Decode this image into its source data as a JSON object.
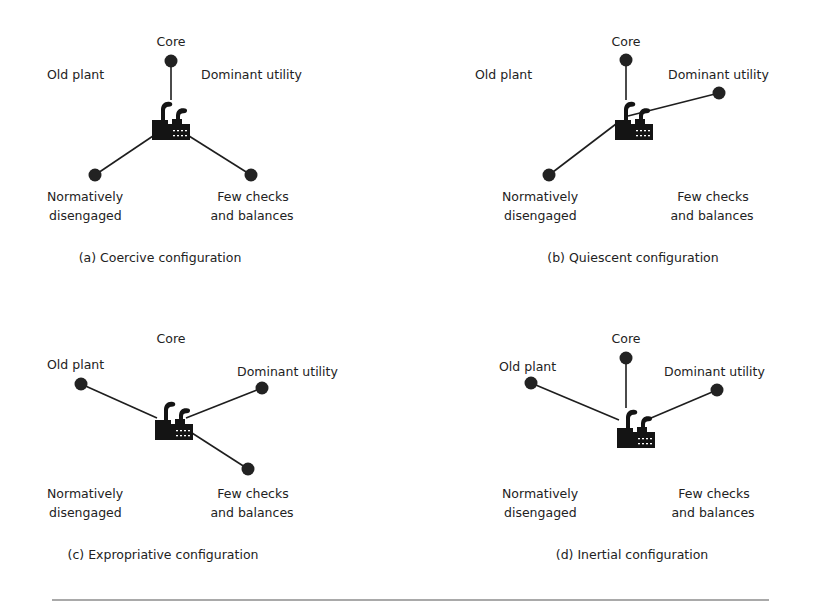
{
  "figure": {
    "panels": [
      {
        "id": "a",
        "caption": "(a) Coercive configuration",
        "caption_pos": [
          160,
          262
        ],
        "factory": [
          152,
          100
        ],
        "labels": {
          "core": {
            "text": "Core",
            "pos": [
              171,
              46
            ],
            "anchor": "middle"
          },
          "old_plant": {
            "text": "Old plant",
            "pos": [
              47,
              79
            ],
            "anchor": "start"
          },
          "dominant_utility": {
            "text": "Dominant utility",
            "pos": [
              201,
              79
            ],
            "anchor": "start"
          },
          "normatively_1": {
            "text": "Normatively",
            "pos": [
              47,
              201
            ],
            "anchor": "start"
          },
          "normatively_2": {
            "text": "disengaged",
            "pos": [
              49,
              220
            ],
            "anchor": "start"
          },
          "few_checks_1": {
            "text": "Few checks",
            "pos": [
              253,
              201
            ],
            "anchor": "middle"
          },
          "few_checks_2": {
            "text": "and balances",
            "pos": [
              252,
              220
            ],
            "anchor": "middle"
          }
        },
        "nodes": [
          {
            "name": "core",
            "pos": [
              171,
              61
            ],
            "anchor": [
              171,
              100
            ]
          },
          {
            "name": "normatively-disengaged",
            "pos": [
              95,
              175
            ],
            "anchor": [
              153,
              136
            ]
          },
          {
            "name": "few-checks",
            "pos": [
              251,
              175
            ],
            "anchor": [
              189,
              136
            ]
          }
        ]
      },
      {
        "id": "b",
        "caption": "(b) Quiescent configuration",
        "caption_pos": [
          633,
          262
        ],
        "factory": [
          615,
          100
        ],
        "labels": {
          "core": {
            "text": "Core",
            "pos": [
              626,
              46
            ],
            "anchor": "middle"
          },
          "old_plant": {
            "text": "Old plant",
            "pos": [
              475,
              79
            ],
            "anchor": "start"
          },
          "dominant_utility": {
            "text": "Dominant utility",
            "pos": [
              668,
              79
            ],
            "anchor": "start"
          },
          "normatively_1": {
            "text": "Normatively",
            "pos": [
              502,
              201
            ],
            "anchor": "start"
          },
          "normatively_2": {
            "text": "disengaged",
            "pos": [
              504,
              220
            ],
            "anchor": "start"
          },
          "few_checks_1": {
            "text": "Few checks",
            "pos": [
              713,
              201
            ],
            "anchor": "middle"
          },
          "few_checks_2": {
            "text": "and balances",
            "pos": [
              712,
              220
            ],
            "anchor": "middle"
          }
        },
        "nodes": [
          {
            "name": "core",
            "pos": [
              626,
              60
            ],
            "anchor": [
              626,
              100
            ]
          },
          {
            "name": "dominant-utility",
            "pos": [
              719,
              93
            ],
            "anchor": [
              628,
              116
            ]
          },
          {
            "name": "normatively-disengaged",
            "pos": [
              549,
              175
            ],
            "anchor": [
              616,
              124
            ]
          }
        ]
      },
      {
        "id": "c",
        "caption": "(c) Expropriative configuration",
        "caption_pos": [
          163,
          559
        ],
        "factory": [
          155,
          400
        ],
        "labels": {
          "core": {
            "text": "Core",
            "pos": [
              171,
              343
            ],
            "anchor": "middle"
          },
          "old_plant": {
            "text": "Old plant",
            "pos": [
              47,
              369
            ],
            "anchor": "start"
          },
          "dominant_utility": {
            "text": "Dominant utility",
            "pos": [
              237,
              376
            ],
            "anchor": "start"
          },
          "normatively_1": {
            "text": "Normatively",
            "pos": [
              47,
              498
            ],
            "anchor": "start"
          },
          "normatively_2": {
            "text": "disengaged",
            "pos": [
              49,
              517
            ],
            "anchor": "start"
          },
          "few_checks_1": {
            "text": "Few checks",
            "pos": [
              253,
              498
            ],
            "anchor": "middle"
          },
          "few_checks_2": {
            "text": "and balances",
            "pos": [
              252,
              517
            ],
            "anchor": "middle"
          }
        },
        "nodes": [
          {
            "name": "old-plant",
            "pos": [
              81,
              384
            ],
            "anchor": [
              157,
              418
            ]
          },
          {
            "name": "dominant-utility",
            "pos": [
              262,
              388
            ],
            "anchor": [
              186,
              418
            ]
          },
          {
            "name": "few-checks",
            "pos": [
              248,
              469
            ],
            "anchor": [
              192,
              433
            ]
          }
        ]
      },
      {
        "id": "d",
        "caption": "(d) Inertial configuration",
        "caption_pos": [
          632,
          559
        ],
        "factory": [
          617,
          408
        ],
        "labels": {
          "core": {
            "text": "Core",
            "pos": [
              626,
              343
            ],
            "anchor": "middle"
          },
          "old_plant": {
            "text": "Old plant",
            "pos": [
              499,
              371
            ],
            "anchor": "start"
          },
          "dominant_utility": {
            "text": "Dominant utility",
            "pos": [
              664,
              376
            ],
            "anchor": "start"
          },
          "normatively_1": {
            "text": "Normatively",
            "pos": [
              502,
              498
            ],
            "anchor": "start"
          },
          "normatively_2": {
            "text": "disengaged",
            "pos": [
              504,
              517
            ],
            "anchor": "start"
          },
          "few_checks_1": {
            "text": "Few checks",
            "pos": [
              714,
              498
            ],
            "anchor": "middle"
          },
          "few_checks_2": {
            "text": "and balances",
            "pos": [
              713,
              517
            ],
            "anchor": "middle"
          }
        },
        "nodes": [
          {
            "name": "core",
            "pos": [
              626,
              358
            ],
            "anchor": [
              626,
              408
            ]
          },
          {
            "name": "old-plant",
            "pos": [
              531,
              383
            ],
            "anchor": [
              619,
              420
            ]
          },
          {
            "name": "dominant-utility",
            "pos": [
              717,
              390
            ],
            "anchor": [
              651,
              418
            ]
          }
        ]
      }
    ],
    "rule": {
      "x1": 52,
      "x2": 769,
      "y": 600
    }
  }
}
